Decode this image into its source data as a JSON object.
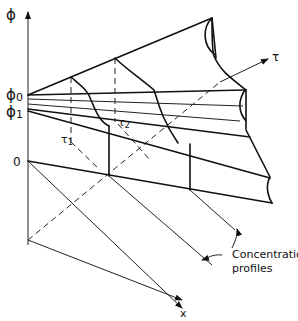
{
  "diagram": {
    "axes": {
      "phi": "ϕ",
      "tau": "τ",
      "x": "x",
      "origin": "0"
    },
    "levels": {
      "phi0": "ϕ",
      "phi0_sub": "0",
      "phi1": "ϕ",
      "phi1_sub": "1"
    },
    "times": {
      "tau1": "τ",
      "tau1_sub": "1",
      "tau2": "τ",
      "tau2_sub": "2"
    },
    "annotation": {
      "line1": "Concentration",
      "line2": "profiles"
    }
  }
}
